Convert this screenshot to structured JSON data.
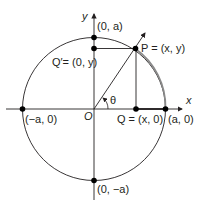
{
  "diagram": {
    "title": "",
    "labels": {
      "y_axis": "y",
      "x_axis": "x",
      "origin": "O",
      "top_point": "(0, a)",
      "left_point": "(−a, 0)",
      "right_point": "(a, 0)",
      "bottom_point": "(0, −a)",
      "q_prime": "Q′= (0, y)",
      "p": "P = (x, y)",
      "q": "Q = (x, 0)",
      "angle": "θ"
    },
    "colors": {
      "stroke": "#231f20",
      "arc_highlight": "#808080",
      "point": "#000000"
    }
  }
}
